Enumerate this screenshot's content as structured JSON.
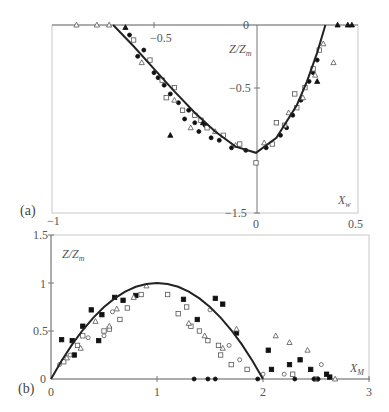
{
  "chart_data": [
    {
      "panel": "(a)",
      "type": "scatter",
      "title": "",
      "xlabel": "X_w",
      "ylabel": "Z/Z_m",
      "xlim": [
        -1,
        0.5
      ],
      "ylim": [
        -1.5,
        0
      ],
      "x_ticks": [
        "-1",
        "-0.5",
        "0",
        "0.5"
      ],
      "y_ticks": [
        "0",
        "-0.5",
        "-1.5"
      ],
      "grid": false,
      "curve": {
        "name": "model",
        "x": [
          -0.7,
          -0.6,
          -0.5,
          -0.4,
          -0.3,
          -0.2,
          -0.1,
          0.0,
          0.1,
          0.2,
          0.25,
          0.3,
          0.34
        ],
        "y": [
          0.0,
          -0.17,
          -0.35,
          -0.53,
          -0.7,
          -0.85,
          -0.97,
          -1.02,
          -0.9,
          -0.64,
          -0.45,
          -0.22,
          0.0
        ]
      },
      "series": [
        {
          "name": "filled-circle",
          "x": [
            -0.62,
            -0.55,
            -0.5,
            -0.45,
            -0.42,
            -0.38,
            -0.35,
            -0.3,
            -0.28,
            -0.22,
            -0.18,
            -0.12,
            -0.05,
            0.05,
            0.12,
            0.18,
            0.22,
            0.26,
            0.3,
            -0.58,
            -0.48,
            -0.33,
            -0.25,
            0.15,
            0.28
          ],
          "y": [
            -0.08,
            -0.2,
            -0.38,
            -0.48,
            -0.55,
            -0.62,
            -0.75,
            -0.78,
            -0.85,
            -0.9,
            -0.92,
            -0.98,
            -1.0,
            -0.98,
            -0.88,
            -0.72,
            -0.6,
            -0.45,
            -0.28,
            -0.25,
            -0.42,
            -0.68,
            -0.8,
            -0.82,
            -0.38
          ]
        },
        {
          "name": "open-square",
          "x": [
            -0.6,
            -0.52,
            -0.46,
            -0.4,
            -0.36,
            -0.3,
            -0.24,
            -0.16,
            -0.08,
            0.0,
            0.08,
            0.14,
            0.2,
            0.24,
            0.28,
            0.31,
            -0.44,
            -0.27,
            0.1,
            0.19
          ],
          "y": [
            -0.12,
            -0.28,
            -0.44,
            -0.5,
            -0.68,
            -0.72,
            -0.82,
            -0.88,
            -0.95,
            -1.1,
            -0.95,
            -0.8,
            -0.66,
            -0.5,
            -0.35,
            -0.2,
            -0.58,
            -0.76,
            -0.78,
            -0.55
          ]
        },
        {
          "name": "open-triangle",
          "x": [
            -0.88,
            -0.78,
            -0.72,
            -0.56,
            -0.4,
            -0.32,
            -0.2,
            -0.1,
            0.04,
            0.16,
            0.23,
            0.29,
            0.33,
            0.38
          ],
          "y": [
            0.0,
            0.0,
            0.0,
            -0.3,
            -0.6,
            -0.82,
            -0.85,
            -0.96,
            -0.94,
            -0.7,
            -0.58,
            -0.4,
            -0.15,
            -0.3
          ]
        },
        {
          "name": "filled-triangle",
          "x": [
            -0.64,
            -0.42,
            -0.26,
            0.3,
            0.4,
            0.45,
            0.47
          ],
          "y": [
            -0.02,
            -0.88,
            -0.78,
            -0.45,
            0.0,
            0.0,
            0.0
          ]
        }
      ]
    },
    {
      "panel": "(b)",
      "type": "scatter",
      "title": "",
      "xlabel": "X_M",
      "ylabel": "Z/Z_m",
      "xlim": [
        0,
        3
      ],
      "ylim": [
        0,
        1.5
      ],
      "x_ticks": [
        "0",
        "1",
        "2",
        "3"
      ],
      "y_ticks": [
        "0",
        "0.5",
        "1",
        "1.5"
      ],
      "grid": false,
      "curve": {
        "name": "model",
        "x": [
          0.0,
          0.1,
          0.2,
          0.3,
          0.4,
          0.5,
          0.6,
          0.7,
          0.8,
          0.9,
          1.0,
          1.1,
          1.2,
          1.3,
          1.4,
          1.5,
          1.6,
          1.7,
          1.8,
          1.9,
          2.0
        ],
        "y": [
          0.0,
          0.19,
          0.36,
          0.51,
          0.64,
          0.75,
          0.84,
          0.91,
          0.96,
          0.99,
          1.0,
          0.99,
          0.96,
          0.91,
          0.84,
          0.75,
          0.64,
          0.51,
          0.36,
          0.19,
          0.0
        ]
      },
      "series": [
        {
          "name": "filled-square",
          "x": [
            0.2,
            0.3,
            0.38,
            0.48,
            0.6,
            0.68,
            0.8,
            1.25,
            1.38,
            1.55,
            1.62,
            1.75,
            2.05,
            2.08,
            2.25,
            2.35,
            2.45,
            2.6,
            2.63,
            0.1,
            0.22,
            0.45
          ],
          "y": [
            0.4,
            0.55,
            0.72,
            0.67,
            0.85,
            0.82,
            0.87,
            0.83,
            0.62,
            0.84,
            0.78,
            0.48,
            0.3,
            0.1,
            0.15,
            0.2,
            0.1,
            0.05,
            0.02,
            0.41,
            0.25,
            0.4
          ]
        },
        {
          "name": "open-square",
          "x": [
            0.12,
            0.25,
            0.3,
            0.5,
            0.55,
            0.65,
            0.72,
            0.85,
            1.1,
            1.2,
            1.28,
            1.4,
            1.48,
            1.6,
            1.7,
            1.85,
            2.28,
            2.5,
            1.32,
            1.58
          ],
          "y": [
            0.18,
            0.35,
            0.45,
            0.5,
            0.52,
            0.62,
            0.74,
            0.88,
            0.88,
            0.68,
            0.75,
            0.5,
            0.4,
            0.25,
            0.15,
            0.1,
            0.05,
            0.0,
            0.55,
            0.35
          ]
        },
        {
          "name": "open-triangle",
          "x": [
            0.15,
            0.28,
            0.42,
            0.55,
            0.62,
            0.78,
            0.9,
            1.3,
            1.45,
            1.62,
            1.75,
            2.12,
            2.25,
            2.42,
            2.68
          ],
          "y": [
            0.22,
            0.32,
            0.6,
            0.55,
            0.73,
            0.85,
            0.97,
            0.58,
            0.45,
            0.32,
            0.52,
            0.45,
            0.38,
            0.3,
            0.0
          ]
        },
        {
          "name": "open-circle",
          "x": [
            0.08,
            0.18,
            0.35,
            0.5,
            0.58,
            1.5,
            1.68,
            1.78,
            2.0,
            2.2,
            2.55
          ],
          "y": [
            0.15,
            0.25,
            0.43,
            0.45,
            0.7,
            0.72,
            0.35,
            0.2,
            0.05,
            0.05,
            0.15
          ]
        },
        {
          "name": "filled-circle",
          "x": [
            1.35,
            1.48,
            1.55,
            1.95,
            2.3,
            2.48,
            2.52
          ],
          "y": [
            0.0,
            0.0,
            0.0,
            0.0,
            0.0,
            0.0,
            0.0
          ]
        }
      ]
    }
  ],
  "labels": {
    "a": {
      "panel": "(a)",
      "ylabel_main": "Z/Z",
      "ylabel_sub": "m",
      "xlabel_main": "X",
      "xlabel_sub": "w",
      "xt_m1": "−1",
      "xt_m05": "−0.5",
      "xt_0": "0",
      "xt_05": "0.5",
      "yt_0": "0",
      "yt_m05": "−0.5",
      "yt_m15": "−1.5"
    },
    "b": {
      "panel": "(b)",
      "ylabel_main": "Z/Z",
      "ylabel_sub": "m",
      "xlabel_main": "X",
      "xlabel_sub": "M",
      "xt_0": "0",
      "xt_1": "1",
      "xt_2": "2",
      "xt_3": "3",
      "yt_0": "0",
      "yt_05": "0.5",
      "yt_1": "1",
      "yt_15": "1.5"
    }
  }
}
